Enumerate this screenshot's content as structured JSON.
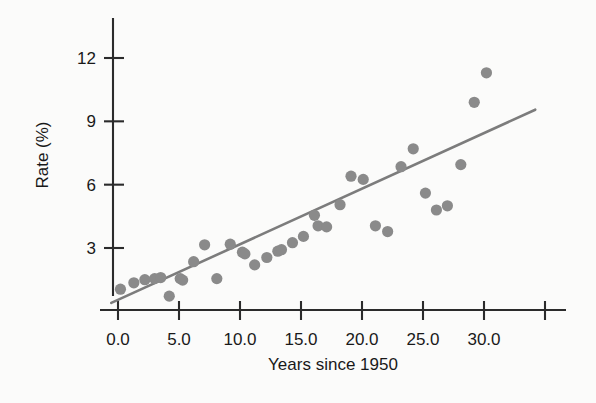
{
  "figure": {
    "background_color": "#fbfbfa",
    "point_color": "#8a8a8a",
    "line_color": "#7c7c7c",
    "axis_color": "#2b2b2b"
  },
  "chart_data": {
    "type": "scatter",
    "title": "",
    "xlabel": "Years since 1950",
    "ylabel": "Rate (%)",
    "xlim": [
      -1.5,
      35.5
    ],
    "ylim": [
      0.0,
      13.2
    ],
    "grid": false,
    "legend": null,
    "xticks": [
      0.0,
      5.0,
      10.0,
      15.0,
      20.0,
      25.0,
      30.0,
      35.0
    ],
    "xtick_labels": [
      "0.0",
      "5.0",
      "10.0",
      "15.0",
      "20.0",
      "25.0",
      "30.0",
      ""
    ],
    "yticks": [
      3,
      6,
      9,
      12
    ],
    "ytick_labels": [
      "3",
      "6",
      "9",
      "12"
    ],
    "series": [
      {
        "name": "observations",
        "marker": "filled-circle",
        "points": [
          {
            "x": 0.2,
            "y": 1.05
          },
          {
            "x": 1.3,
            "y": 1.35
          },
          {
            "x": 2.2,
            "y": 1.5
          },
          {
            "x": 3.0,
            "y": 1.55
          },
          {
            "x": 3.5,
            "y": 1.6
          },
          {
            "x": 4.2,
            "y": 0.72
          },
          {
            "x": 5.1,
            "y": 1.55
          },
          {
            "x": 5.3,
            "y": 1.48
          },
          {
            "x": 6.2,
            "y": 2.35
          },
          {
            "x": 7.1,
            "y": 3.15
          },
          {
            "x": 8.1,
            "y": 1.55
          },
          {
            "x": 9.2,
            "y": 3.18
          },
          {
            "x": 10.2,
            "y": 2.8
          },
          {
            "x": 10.4,
            "y": 2.72
          },
          {
            "x": 11.2,
            "y": 2.2
          },
          {
            "x": 12.2,
            "y": 2.55
          },
          {
            "x": 13.1,
            "y": 2.85
          },
          {
            "x": 13.4,
            "y": 2.92
          },
          {
            "x": 14.3,
            "y": 3.25
          },
          {
            "x": 15.2,
            "y": 3.55
          },
          {
            "x": 16.1,
            "y": 4.55
          },
          {
            "x": 16.4,
            "y": 4.05
          },
          {
            "x": 17.1,
            "y": 4.0
          },
          {
            "x": 18.2,
            "y": 5.05
          },
          {
            "x": 19.1,
            "y": 6.4
          },
          {
            "x": 20.1,
            "y": 6.25
          },
          {
            "x": 21.1,
            "y": 4.05
          },
          {
            "x": 22.1,
            "y": 3.78
          },
          {
            "x": 23.2,
            "y": 6.85
          },
          {
            "x": 24.2,
            "y": 7.7
          },
          {
            "x": 25.2,
            "y": 5.6
          },
          {
            "x": 26.1,
            "y": 4.8
          },
          {
            "x": 27.0,
            "y": 5.0
          },
          {
            "x": 28.1,
            "y": 6.95
          },
          {
            "x": 29.2,
            "y": 9.9
          },
          {
            "x": 30.2,
            "y": 11.3
          }
        ]
      }
    ],
    "trend_line": {
      "name": "least-squares fit",
      "x_start": -0.55,
      "y_start": 0.4,
      "x_end": 34.2,
      "y_end": 9.55
    }
  }
}
